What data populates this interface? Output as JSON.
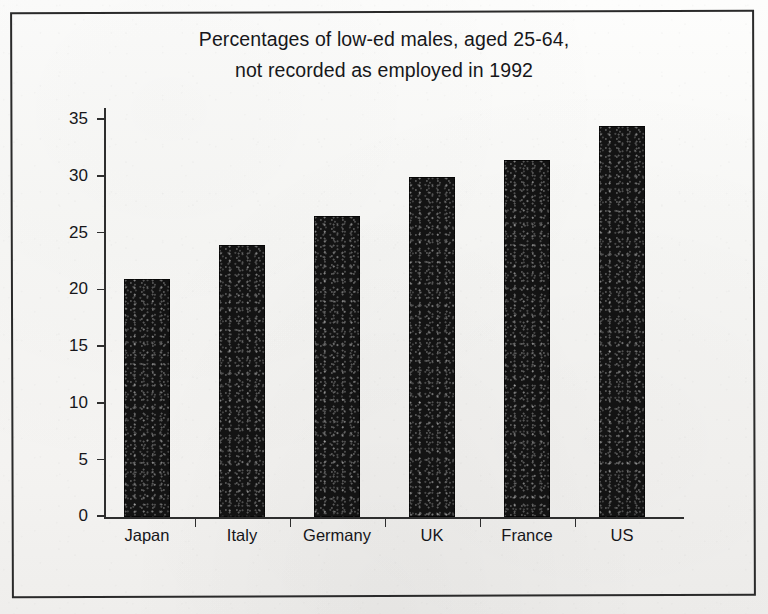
{
  "chart_data": {
    "type": "bar",
    "title": "Percentages of low-ed males, aged 25-64,\nnot recorded as employed in 1992",
    "title_line1": "Percentages of low-ed males, aged 25-64,",
    "title_line2": "not recorded as employed in 1992",
    "categories": [
      "Japan",
      "Italy",
      "Germany",
      "UK",
      "France",
      "US"
    ],
    "values": [
      21,
      24,
      26.5,
      30,
      31.5,
      34.5
    ],
    "xlabel": "",
    "ylabel": "",
    "ylim": [
      0,
      35
    ],
    "ytick_labels": [
      "0",
      "5",
      "10",
      "15",
      "20",
      "25",
      "30",
      "35"
    ],
    "ytick_values": [
      0,
      5,
      10,
      15,
      20,
      25,
      30,
      35
    ],
    "grid": false,
    "legend": false,
    "bar_color": "#131313",
    "axis_color": "#2e2e2e",
    "text_color": "#16161a",
    "background_color": "#f6f5f3",
    "frame_color": "#2a2a2a"
  }
}
